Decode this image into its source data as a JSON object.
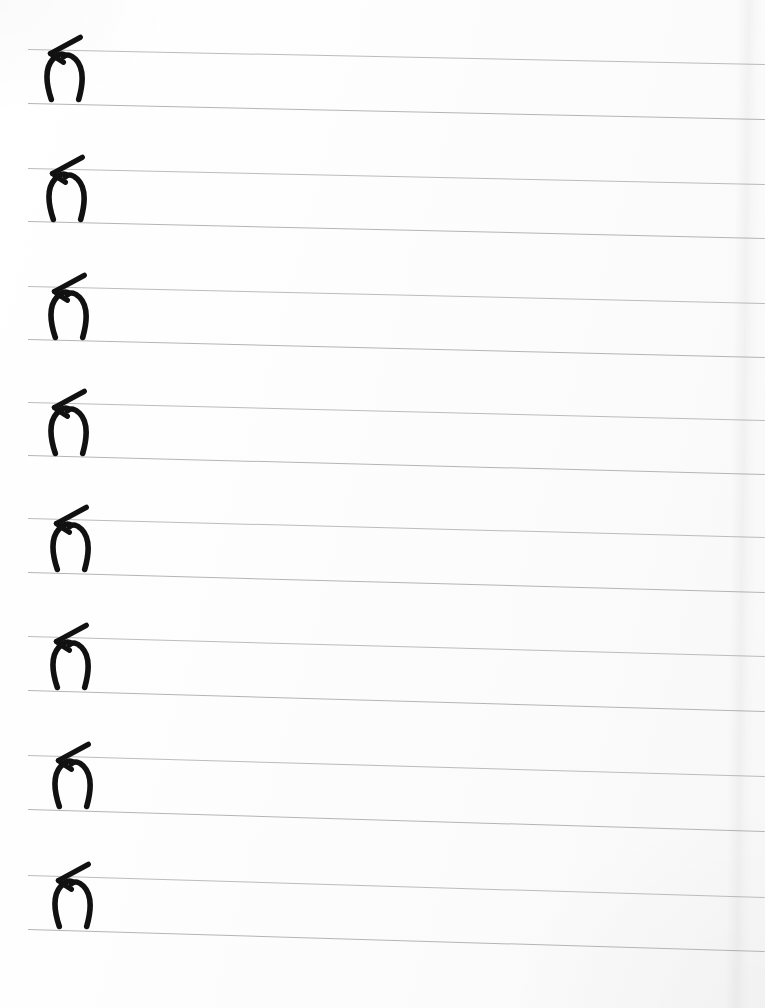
{
  "document": {
    "kind": "handwriting-practice-sheet",
    "title": "Handwriting practice sheet",
    "description": "Scanned lined paper with one handwritten character repeated on eight ruled rows",
    "page_width": 765,
    "page_height": 1008,
    "background_color": "#ffffff",
    "rule_color": "#b9bcc2",
    "ink_color": "#111111",
    "row_count": 8,
    "glyph_repetitions": 8
  },
  "glyph": {
    "name": "handwritten-character",
    "semantic": "bowl-with-diagonal-crossbar",
    "unicode_approx": "ɣ",
    "stroke_color": "#111111",
    "stroke_width_px": 7
  },
  "rows": [
    {
      "index": 1,
      "label": "row-1",
      "top_line_y_left": 49,
      "top_line_y_right": 64,
      "baseline_y_left": 103,
      "baseline_y_right": 119,
      "glyph_x": 40,
      "glyph_top": 28,
      "glyph_height": 80,
      "glyph": "ɣ"
    },
    {
      "index": 2,
      "label": "row-2",
      "top_line_y_left": 168,
      "top_line_y_right": 184,
      "baseline_y_left": 221,
      "baseline_y_right": 238,
      "glyph_x": 42,
      "glyph_top": 148,
      "glyph_height": 80,
      "glyph": "ɣ"
    },
    {
      "index": 3,
      "label": "row-3",
      "top_line_y_left": 286,
      "top_line_y_right": 303,
      "baseline_y_left": 339,
      "baseline_y_right": 357,
      "glyph_x": 44,
      "glyph_top": 266,
      "glyph_height": 80,
      "glyph": "ɣ"
    },
    {
      "index": 4,
      "label": "row-4",
      "top_line_y_left": 402,
      "top_line_y_right": 420,
      "baseline_y_left": 455,
      "baseline_y_right": 474,
      "glyph_x": 44,
      "glyph_top": 382,
      "glyph_height": 80,
      "glyph": "ɣ"
    },
    {
      "index": 5,
      "label": "row-5",
      "top_line_y_left": 518,
      "top_line_y_right": 537,
      "baseline_y_left": 572,
      "baseline_y_right": 592,
      "glyph_x": 46,
      "glyph_top": 498,
      "glyph_height": 80,
      "glyph": "ɣ"
    },
    {
      "index": 6,
      "label": "row-6",
      "top_line_y_left": 636,
      "top_line_y_right": 656,
      "baseline_y_left": 690,
      "baseline_y_right": 711,
      "glyph_x": 46,
      "glyph_top": 616,
      "glyph_height": 80,
      "glyph": "ɣ"
    },
    {
      "index": 7,
      "label": "row-7",
      "top_line_y_left": 755,
      "top_line_y_right": 776,
      "baseline_y_left": 809,
      "baseline_y_right": 831,
      "glyph_x": 48,
      "glyph_top": 735,
      "glyph_height": 80,
      "glyph": "ɣ"
    },
    {
      "index": 8,
      "label": "row-8",
      "top_line_y_left": 875,
      "top_line_y_right": 897,
      "baseline_y_left": 929,
      "baseline_y_right": 951,
      "glyph_x": 48,
      "glyph_top": 855,
      "glyph_height": 80,
      "glyph": "ɣ"
    }
  ]
}
